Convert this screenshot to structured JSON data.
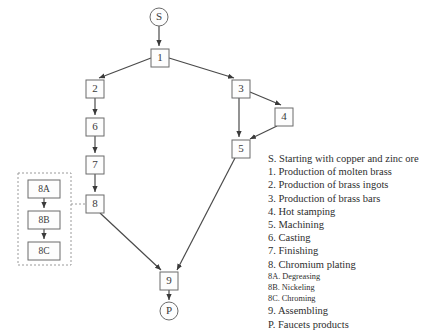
{
  "diagram": {
    "nodes": [
      {
        "id": "S",
        "label": "S",
        "shape": "circle",
        "cx": 159,
        "cy": 17,
        "r": 9
      },
      {
        "id": "1",
        "label": "1",
        "shape": "box",
        "x": 151,
        "y": 49,
        "w": 18,
        "h": 18
      },
      {
        "id": "2",
        "label": "2",
        "shape": "box",
        "x": 86,
        "y": 80,
        "w": 18,
        "h": 18
      },
      {
        "id": "3",
        "label": "3",
        "shape": "box",
        "x": 232,
        "y": 80,
        "w": 18,
        "h": 18
      },
      {
        "id": "4",
        "label": "4",
        "shape": "box",
        "x": 275,
        "y": 108,
        "w": 18,
        "h": 18
      },
      {
        "id": "5",
        "label": "5",
        "shape": "box",
        "x": 232,
        "y": 140,
        "w": 18,
        "h": 18
      },
      {
        "id": "6",
        "label": "6",
        "shape": "box",
        "x": 86,
        "y": 118,
        "w": 18,
        "h": 18
      },
      {
        "id": "7",
        "label": "7",
        "shape": "box",
        "x": 86,
        "y": 156,
        "w": 18,
        "h": 18
      },
      {
        "id": "8",
        "label": "8",
        "shape": "box",
        "x": 86,
        "y": 195,
        "w": 18,
        "h": 18
      },
      {
        "id": "8A",
        "label": "8A",
        "shape": "box",
        "x": 28,
        "y": 180,
        "w": 32,
        "h": 18
      },
      {
        "id": "8B",
        "label": "8B",
        "shape": "box",
        "x": 28,
        "y": 211,
        "w": 32,
        "h": 18
      },
      {
        "id": "8C",
        "label": "8C",
        "shape": "box",
        "x": 28,
        "y": 242,
        "w": 32,
        "h": 18
      },
      {
        "id": "9",
        "label": "9",
        "shape": "box",
        "x": 160,
        "y": 272,
        "w": 18,
        "h": 18
      },
      {
        "id": "P",
        "label": "P",
        "shape": "circle",
        "cx": 169,
        "cy": 311,
        "r": 9
      }
    ],
    "edges": [
      {
        "from": "S",
        "to": "1",
        "style": "solid"
      },
      {
        "from": "1",
        "to": "2",
        "style": "solid"
      },
      {
        "from": "1",
        "to": "3",
        "style": "solid"
      },
      {
        "from": "2",
        "to": "6",
        "style": "solid"
      },
      {
        "from": "6",
        "to": "7",
        "style": "solid"
      },
      {
        "from": "7",
        "to": "8",
        "style": "solid"
      },
      {
        "from": "8",
        "to": "9",
        "style": "solid"
      },
      {
        "from": "3",
        "to": "4",
        "style": "solid"
      },
      {
        "from": "3",
        "to": "5",
        "style": "solid"
      },
      {
        "from": "4",
        "to": "5",
        "style": "solid"
      },
      {
        "from": "5",
        "to": "9",
        "style": "solid"
      },
      {
        "from": "9",
        "to": "P",
        "style": "solid"
      },
      {
        "from": "8A",
        "to": "8B",
        "style": "solid"
      },
      {
        "from": "8B",
        "to": "8C",
        "style": "solid"
      },
      {
        "from": "8-group",
        "to": "8",
        "style": "dashed"
      }
    ],
    "group_box": {
      "x": 18,
      "y": 173,
      "w": 53,
      "h": 92,
      "style": "dashed"
    }
  },
  "legend": {
    "items": [
      {
        "text": "S. Starting with copper and zinc ore",
        "sub": false
      },
      {
        "text": "1. Production of molten brass",
        "sub": false
      },
      {
        "text": "2. Production of brass ingots",
        "sub": false
      },
      {
        "text": "3. Production of brass bars",
        "sub": false
      },
      {
        "text": "4. Hot stamping",
        "sub": false
      },
      {
        "text": "5. Machining",
        "sub": false
      },
      {
        "text": "6. Casting",
        "sub": false
      },
      {
        "text": "7. Finishing",
        "sub": false
      },
      {
        "text": "8. Chromium plating",
        "sub": false
      },
      {
        "text": "8A. Degreasing",
        "sub": true
      },
      {
        "text": "8B. Nickeling",
        "sub": true
      },
      {
        "text": "8C. Chroming",
        "sub": true
      },
      {
        "text": "9. Assembling",
        "sub": false
      },
      {
        "text": "P. Faucets products",
        "sub": false
      }
    ]
  },
  "colors": {
    "background": "#ffffff",
    "node_stroke": "#6b6b6b",
    "edge": "#4a4a4a",
    "dashed": "#9a9a9a",
    "text": "#2e2e2e"
  }
}
